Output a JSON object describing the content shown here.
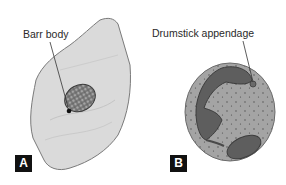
{
  "figure": {
    "panels": [
      {
        "id": "A",
        "badge": "A",
        "annotation": "Barr body",
        "cell_fill": "#d9d9d9",
        "cell_outline": "#7a7a7a",
        "nucleus_fill": "#6e6e6e"
      },
      {
        "id": "B",
        "badge": "B",
        "annotation": "Drumstick appendage",
        "cell_fill": "#a3a3a3",
        "cell_outline": "#6b6b6b",
        "nucleus_fill": "#5a5a5a"
      }
    ]
  }
}
